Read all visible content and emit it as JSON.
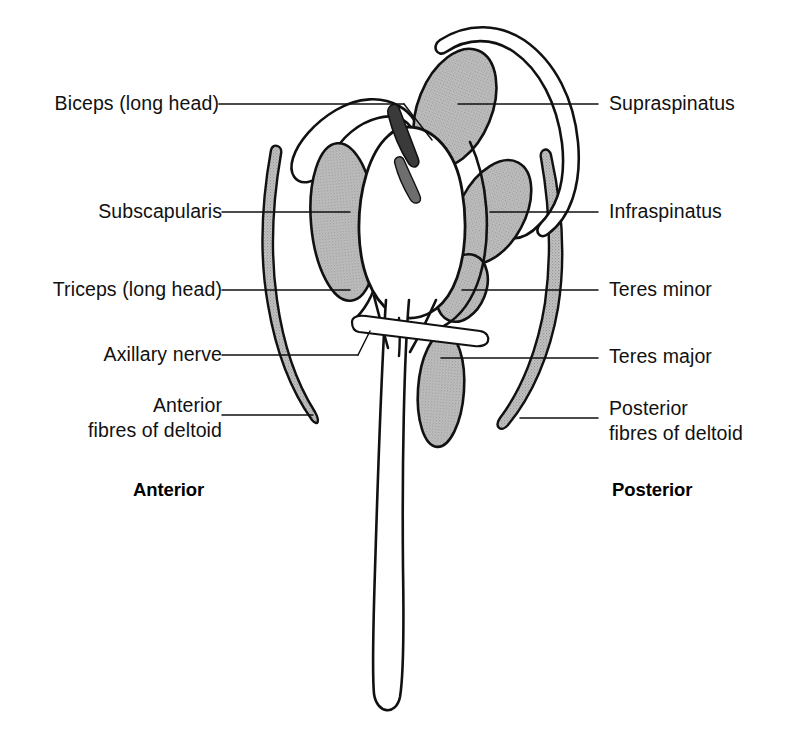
{
  "figure": {
    "background_color": "#ffffff",
    "ink_color": "#111111",
    "muscle_fill_color": "#b8b8b8"
  },
  "labels_left": [
    {
      "id": "biceps",
      "text": "Biceps (long head)"
    },
    {
      "id": "subscapularis",
      "text": "Subscapularis"
    },
    {
      "id": "triceps",
      "text": "Triceps (long head)"
    },
    {
      "id": "axillary-nerve",
      "text": "Axillary nerve"
    },
    {
      "id": "anterior-deltoid-line1",
      "text": "Anterior"
    },
    {
      "id": "anterior-deltoid-line2",
      "text": "fibres of deltoid"
    }
  ],
  "labels_right": [
    {
      "id": "supraspinatus",
      "text": "Supraspinatus"
    },
    {
      "id": "infraspinatus",
      "text": "Infraspinatus"
    },
    {
      "id": "teres-minor",
      "text": "Teres minor"
    },
    {
      "id": "teres-major",
      "text": "Teres major"
    },
    {
      "id": "posterior-deltoid-line1",
      "text": "Posterior"
    },
    {
      "id": "posterior-deltoid-line2",
      "text": "fibres of deltoid"
    }
  ],
  "orientation": {
    "anterior": "Anterior",
    "posterior": "Posterior"
  }
}
